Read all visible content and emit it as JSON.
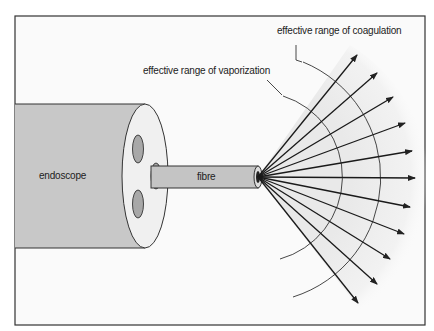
{
  "diagram": {
    "labels": {
      "coagulation": "effective range of coagulation",
      "vaporization": "effective range of vaporization",
      "endoscope": "endoscope",
      "fibre": "fibre"
    },
    "colors": {
      "background": "#fafafa",
      "frame": "#333333",
      "endoscope_body": "#c8c8c8",
      "end_face": "#f0f0f0",
      "channel": "#a8a8a8",
      "fibre": "#c4c4c4",
      "glow": "#ececec",
      "stroke": "#222222"
    },
    "beam": {
      "origin": [
        258,
        177
      ],
      "arrow_count": 11,
      "arrow_tips": [
        [
          357,
          55
        ],
        [
          377,
          73
        ],
        [
          393,
          97
        ],
        [
          405,
          123
        ],
        [
          412,
          151
        ],
        [
          415,
          178
        ],
        [
          410,
          207
        ],
        [
          404,
          234
        ],
        [
          390,
          259
        ],
        [
          377,
          284
        ],
        [
          358,
          303
        ]
      ]
    }
  }
}
